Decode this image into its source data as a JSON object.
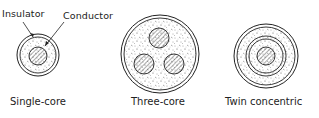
{
  "diagram": {
    "annotations": {
      "insulator": "Insulator",
      "conductor": "Conductor"
    },
    "cables": [
      {
        "caption": "Single-core",
        "cores": 1
      },
      {
        "caption": "Three-core",
        "cores": 3
      },
      {
        "caption": "Twin concentric",
        "cores": 2
      }
    ],
    "colors": {
      "line": "#222222",
      "background": "#ffffff"
    }
  }
}
